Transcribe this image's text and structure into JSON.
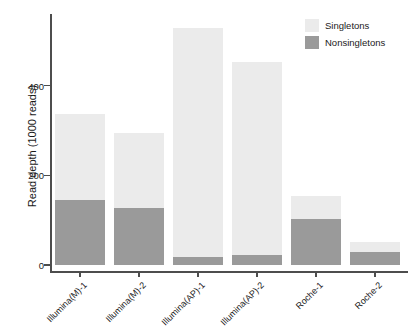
{
  "chart_data": {
    "type": "bar",
    "stacked": true,
    "title": "",
    "xlabel": "",
    "ylabel": "Read depth (1000 reads)",
    "ylim": [
      0,
      560
    ],
    "yticks": [
      0,
      200,
      400
    ],
    "ytick_labels": [
      "0",
      "200",
      "400"
    ],
    "grid": false,
    "legend_position": "top-right",
    "categories": [
      "Illumina(M)-1",
      "Illumina(M)-2",
      "Illumina(AP)-1",
      "Illumina(AP)-2",
      "Roche-1",
      "Roche-2"
    ],
    "series": [
      {
        "name": "Nonsingletons",
        "color": "#9a9a9a",
        "values": [
          145,
          128,
          18,
          22,
          103,
          30
        ]
      },
      {
        "name": "Singletons",
        "color": "#ebebeb",
        "values": [
          193,
          167,
          510,
          431,
          51,
          21
        ]
      }
    ],
    "totals": [
      338,
      295,
      528,
      453,
      154,
      51
    ]
  },
  "legend": {
    "entries": [
      {
        "label": "Singletons",
        "color": "#ebebeb"
      },
      {
        "label": "Nonsingletons",
        "color": "#9a9a9a"
      }
    ]
  },
  "axes": {
    "y_title": "Read depth (1000 reads)"
  }
}
